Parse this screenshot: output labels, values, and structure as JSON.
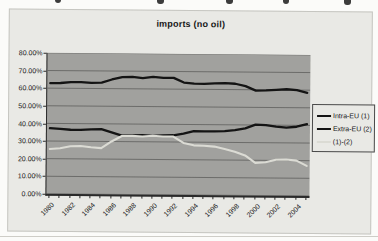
{
  "chart": {
    "title": "imports (no oil)",
    "colors": {
      "page_bg": "#fbfbf9",
      "chart_bg": "#e9e9e5",
      "plot_bg": "#a1a19e",
      "gridline": "#4a4a48",
      "axis": "#2a2a2a",
      "series_black": "#141414",
      "series_light": "#dbdbd4"
    },
    "legend": {
      "items": [
        {
          "label": "Intra-EU (1)",
          "swatch_color": "#141414"
        },
        {
          "label": "Extra-EU (2)",
          "swatch_color": "#141414"
        },
        {
          "label": "(1)-(2)",
          "swatch_color": "#dbdbd4"
        }
      ]
    }
  },
  "chart_data": {
    "type": "line",
    "title": "imports (no oil)",
    "x": [
      1980,
      1981,
      1982,
      1983,
      1984,
      1985,
      1986,
      1987,
      1988,
      1989,
      1990,
      1991,
      1992,
      1993,
      1994,
      1995,
      1996,
      1997,
      1998,
      1999,
      2000,
      2001,
      2002,
      2003,
      2004,
      2005
    ],
    "x_tick_labels": [
      "1980",
      "1982",
      "1984",
      "1986",
      "1988",
      "1990",
      "1992",
      "1994",
      "1996",
      "1998",
      "2000",
      "2002",
      "2004"
    ],
    "y_tick_labels": [
      "80.00%",
      "70.00%",
      "60.00%",
      "50.00%",
      "40.00%",
      "30.00%",
      "20.00%",
      "10.00%",
      "0.00%"
    ],
    "ylim": [
      0,
      80
    ],
    "grid": true,
    "legend_position": "right",
    "plot_background": "gray",
    "series": [
      {
        "name": "Intra-EU (1)",
        "color": "#141414",
        "width": 2.3,
        "values": [
          62.8,
          63.0,
          63.5,
          63.6,
          63.2,
          63.4,
          65.2,
          66.6,
          66.8,
          66.1,
          66.9,
          66.3,
          66.4,
          63.8,
          63.2,
          63.1,
          63.5,
          63.6,
          63.3,
          62.0,
          59.5,
          59.7,
          60.1,
          60.4,
          60.0,
          58.5
        ]
      },
      {
        "name": "Extra-EU (2)",
        "color": "#141414",
        "width": 2.3,
        "values": [
          37.3,
          37.0,
          36.5,
          36.4,
          36.8,
          37.0,
          35.2,
          33.4,
          33.6,
          33.7,
          33.4,
          33.7,
          33.8,
          34.8,
          36.3,
          36.2,
          36.2,
          36.4,
          37.0,
          38.0,
          40.2,
          40.0,
          39.2,
          38.7,
          39.2,
          40.7
        ]
      },
      {
        "name": "(1)-(2)",
        "color": "#dbdbd4",
        "width": 2.1,
        "values": [
          25.5,
          26.0,
          27.1,
          27.3,
          26.6,
          26.2,
          30.0,
          33.2,
          33.3,
          33.0,
          33.5,
          33.1,
          33.1,
          29.5,
          28.2,
          28.0,
          27.6,
          26.2,
          24.8,
          22.7,
          18.5,
          18.9,
          20.4,
          20.6,
          20.0,
          17.0
        ]
      }
    ]
  }
}
